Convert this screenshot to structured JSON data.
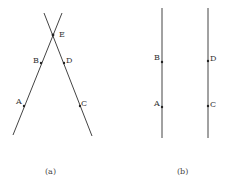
{
  "figure_a": {
    "caption": "(a)",
    "labels": {
      "A": "A",
      "B": "B",
      "C": "C",
      "D": "D",
      "E": "E"
    }
  },
  "figure_b": {
    "caption": "(b)",
    "labels": {
      "A": "A",
      "B": "B",
      "C": "C",
      "D": "D"
    }
  }
}
